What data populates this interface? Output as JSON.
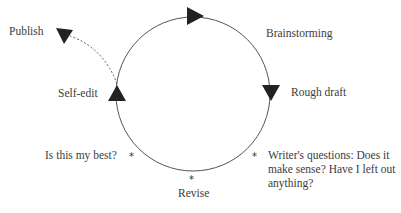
{
  "diagram": {
    "colors": {
      "line": "#555555",
      "arrow": "#222222",
      "text": "#3c3c3c"
    },
    "stages": [
      {
        "id": "brainstorming",
        "label": "Brainstorming"
      },
      {
        "id": "rough-draft",
        "label": "Rough draft"
      },
      {
        "id": "revise",
        "label": "Revise"
      },
      {
        "id": "self-edit",
        "label": "Self-edit"
      },
      {
        "id": "publish",
        "label": "Publish"
      }
    ],
    "notes": [
      {
        "id": "writers-questions",
        "marker": "*",
        "text": "Writer's questions: Does it make sense? Have I left out anything?"
      },
      {
        "id": "is-this-my-best",
        "marker": "*",
        "text": "Is this my best?"
      },
      {
        "id": "revise-marker",
        "marker": "*"
      }
    ],
    "edges": [
      {
        "from": "self-edit",
        "to": "brainstorming",
        "style": "solid",
        "direction": "clockwise"
      },
      {
        "from": "brainstorming",
        "to": "rough-draft",
        "style": "solid",
        "direction": "clockwise"
      },
      {
        "from": "rough-draft",
        "to": "revise",
        "style": "solid",
        "direction": "clockwise"
      },
      {
        "from": "revise",
        "to": "self-edit",
        "style": "solid",
        "direction": "clockwise"
      },
      {
        "from": "self-edit",
        "to": "publish",
        "style": "dashed"
      }
    ]
  }
}
